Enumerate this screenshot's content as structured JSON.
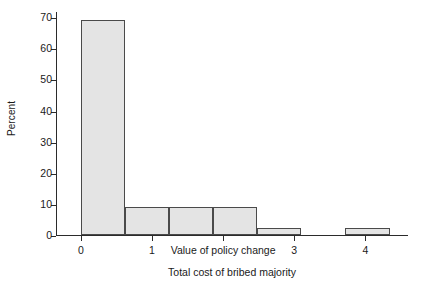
{
  "chart_data": {
    "type": "bar",
    "title": "",
    "subtitle": "",
    "xlabel": "Total cost of bribed majority",
    "ylabel": "Percent",
    "xlim": [
      -0.35,
      4.6
    ],
    "ylim": [
      0,
      72
    ],
    "grid": false,
    "legend": null,
    "xtick_values": [
      0,
      1,
      2,
      3,
      4
    ],
    "xtick_labels": [
      "0",
      "1",
      "Value of policy change",
      "3",
      "4"
    ],
    "ytick_values": [
      0,
      10,
      20,
      30,
      40,
      50,
      60,
      70
    ],
    "ytick_labels": [
      "0",
      "10",
      "20",
      "30",
      "40",
      "50",
      "60",
      "70"
    ],
    "annotations": [
      {
        "text": "Value of policy change",
        "x": 2,
        "note": "replaces the x tick label at x = 2"
      }
    ],
    "bin_width": 0.62,
    "bars": [
      {
        "x_start": 0.0,
        "x_end": 0.62,
        "value": 69.0
      },
      {
        "x_start": 0.62,
        "x_end": 1.24,
        "value": 9.0
      },
      {
        "x_start": 1.24,
        "x_end": 1.86,
        "value": 9.0
      },
      {
        "x_start": 1.86,
        "x_end": 2.48,
        "value": 9.0
      },
      {
        "x_start": 2.48,
        "x_end": 3.1,
        "value": 2.3
      },
      {
        "x_start": 3.72,
        "x_end": 4.34,
        "value": 2.3
      }
    ],
    "categories": [
      "0-0.62",
      "0.62-1.24",
      "1.24-1.86",
      "1.86-2.48",
      "2.48-3.10",
      "3.72-4.34"
    ],
    "values": [
      69.0,
      9.0,
      9.0,
      9.0,
      2.3,
      2.3
    ],
    "colors": {
      "bar_fill": "#e4e4e4",
      "bar_edge": "#4a4a4a",
      "axis": "#2b2b2b",
      "text": "#1a1a1a",
      "background": "#ffffff"
    }
  }
}
